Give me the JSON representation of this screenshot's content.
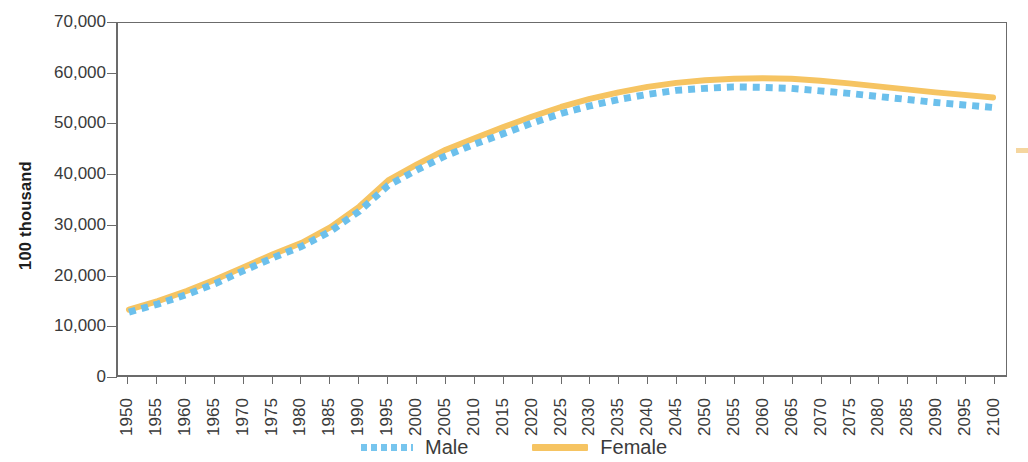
{
  "chart_data": {
    "type": "line",
    "title": "",
    "xlabel": "",
    "ylabel": "100 thousand",
    "ylim": [
      0,
      70000
    ],
    "xlim": [
      1950,
      2100
    ],
    "grid": false,
    "legend_position": "bottom-center",
    "y_ticks": [
      "0",
      "10,000",
      "20,000",
      "30,000",
      "40,000",
      "50,000",
      "60,000",
      "70,000"
    ],
    "y_tick_values": [
      0,
      10000,
      20000,
      30000,
      40000,
      50000,
      60000,
      70000
    ],
    "categories": [
      "1950",
      "1955",
      "1960",
      "1965",
      "1970",
      "1975",
      "1980",
      "1985",
      "1990",
      "1995",
      "2000",
      "2005",
      "2010",
      "2015",
      "2020",
      "2025",
      "2030",
      "2035",
      "2040",
      "2045",
      "2050",
      "2055",
      "2060",
      "2065",
      "2070",
      "2075",
      "2080",
      "2085",
      "2090",
      "2095",
      "2100"
    ],
    "x": [
      1950,
      1955,
      1960,
      1965,
      1970,
      1975,
      1980,
      1985,
      1990,
      1995,
      2000,
      2005,
      2010,
      2015,
      2020,
      2025,
      2030,
      2035,
      2040,
      2045,
      2050,
      2055,
      2060,
      2065,
      2070,
      2075,
      2080,
      2085,
      2090,
      2095,
      2100
    ],
    "series": [
      {
        "name": "Male",
        "color": "#6cc0ec",
        "style": "dotted",
        "values": [
          12500,
          14100,
          16000,
          18200,
          20800,
          23300,
          25600,
          28600,
          32600,
          37700,
          40800,
          43600,
          45900,
          48000,
          50100,
          52000,
          53500,
          54800,
          55800,
          56600,
          57000,
          57300,
          57200,
          57000,
          56500,
          56000,
          55400,
          54800,
          54200,
          53700,
          53200
        ]
      },
      {
        "name": "Female",
        "color": "#f6c462",
        "style": "solid",
        "values": [
          13000,
          14700,
          16700,
          19000,
          21500,
          24000,
          26300,
          29400,
          33500,
          38700,
          41900,
          44800,
          47100,
          49300,
          51400,
          53300,
          54900,
          56200,
          57300,
          58100,
          58600,
          58900,
          59000,
          58900,
          58500,
          58000,
          57400,
          56800,
          56200,
          55700,
          55200
        ]
      }
    ]
  },
  "legend": {
    "items": [
      {
        "label": "Male",
        "color": "#6cc0ec",
        "style": "dotted"
      },
      {
        "label": "Female",
        "color": "#f6c462",
        "style": "solid"
      }
    ]
  },
  "axes": {
    "y_title": "100 thousand"
  }
}
